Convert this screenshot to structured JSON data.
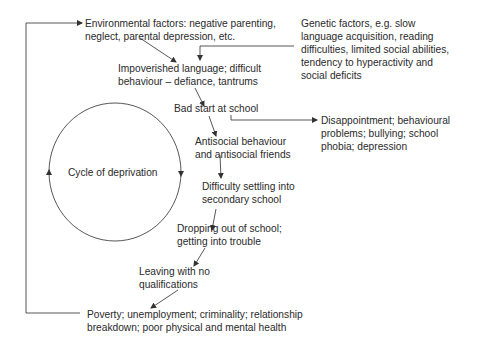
{
  "diagram": {
    "center_label": "Cycle of deprivation",
    "nodes": {
      "environmental": [
        "Environmental factors: negative parenting,",
        "neglect, parental depression, etc."
      ],
      "genetic": [
        "Genetic factors, e.g. slow",
        "language acquisition, reading",
        "difficulties, limited social abilities,",
        "tendency to hyperactivity and",
        "social deficits"
      ],
      "impoverished": [
        "Impoverished language; difficult",
        "behaviour – defiance, tantrums"
      ],
      "bad_start": [
        "Bad start at school"
      ],
      "disappointment": [
        "Disappointment; behavioural",
        "problems; bullying; school",
        "phobia; depression"
      ],
      "antisocial": [
        "Antisocial behaviour",
        "and antisocial friends"
      ],
      "difficulty": [
        "Difficulty settling into",
        "secondary school"
      ],
      "dropping": [
        "Dropping out of school;",
        "getting into trouble"
      ],
      "leaving": [
        "Leaving with no",
        "qualifications"
      ],
      "poverty": [
        "Poverty; unemployment; criminality; relationship",
        "breakdown; poor physical and mental health"
      ]
    },
    "colors": {
      "line": "#333333",
      "text": "#2a2a2a",
      "background": "#ffffff"
    }
  }
}
